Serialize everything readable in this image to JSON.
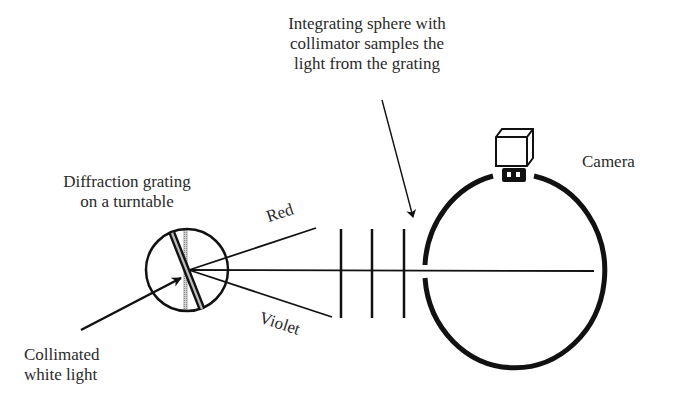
{
  "diagram": {
    "labels": {
      "sphere_caption": [
        "Integrating sphere with",
        "collimator samples the",
        "light from the grating"
      ],
      "camera": "Camera",
      "grating_caption": [
        "Diffraction grating",
        "on a turntable"
      ],
      "red_ray": "Red",
      "violet_ray": "Violet",
      "input_caption": [
        "Collimated",
        "white light"
      ]
    },
    "components": [
      {
        "name": "diffraction-grating-turntable",
        "shape": "circle"
      },
      {
        "name": "collimator-baffles",
        "count": 3
      },
      {
        "name": "integrating-sphere",
        "shape": "ellipse"
      },
      {
        "name": "camera",
        "position": "top of sphere"
      }
    ],
    "connections": [
      {
        "from": "collimated-white-light",
        "to": "diffraction-grating-turntable",
        "type": "arrow"
      },
      {
        "from": "diffraction-grating-turntable",
        "to": "red-ray",
        "type": "line"
      },
      {
        "from": "diffraction-grating-turntable",
        "to": "violet-ray",
        "type": "line"
      },
      {
        "from": "diffraction-grating-turntable",
        "to": "integrating-sphere",
        "type": "line",
        "through": "collimator-baffles"
      },
      {
        "from": "sphere-caption",
        "to": "collimator-baffles",
        "type": "arrow"
      }
    ],
    "colors": {
      "line": "#111111",
      "text": "#2a2a2a",
      "hatch": "#9a9a9a",
      "background": "#ffffff"
    }
  }
}
